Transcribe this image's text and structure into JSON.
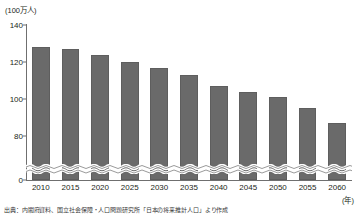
{
  "chart_data": {
    "type": "bar",
    "title": "",
    "subtitle": "",
    "unit_label": "(100万人)",
    "xlabel": "(年)",
    "ylabel": "",
    "categories": [
      "2010",
      "2015",
      "2020",
      "2025",
      "2030",
      "2035",
      "2040",
      "2045",
      "2050",
      "2055",
      "2060"
    ],
    "values": [
      128,
      127,
      124,
      120,
      117,
      113,
      107,
      104,
      101,
      95,
      87
    ],
    "ylim": [
      0,
      140
    ],
    "yticks": [
      0,
      80,
      100,
      120,
      140
    ],
    "ytick_labels": [
      "0",
      "80",
      "100",
      "120",
      "140"
    ],
    "axis_break": true,
    "axis_break_between": [
      0,
      80
    ],
    "grid": false,
    "legend": false,
    "bar_color": "#6a6a6a",
    "axis_color": "#6f6f6f",
    "series": [
      {
        "name": "総人口",
        "values": [
          128,
          127,
          124,
          120,
          117,
          113,
          107,
          104,
          101,
          95,
          87
        ]
      }
    ]
  },
  "axis": {
    "unit_label": "(100万人)",
    "year_unit": "(年)",
    "yticks": [
      {
        "label": "140",
        "value": 140
      },
      {
        "label": "120",
        "value": 120
      },
      {
        "label": "100",
        "value": 100
      },
      {
        "label": "80",
        "value": 80
      },
      {
        "label": "0",
        "value": 0
      }
    ]
  },
  "source": {
    "text": "出典：内閣府資料、国立社会保障・人口問題研究所「日本の将来推計人口」より作成"
  },
  "colors": {
    "bar": "#6a6a6a",
    "axis": "#6f6f6f",
    "text": "#231f20",
    "background": "#ffffff"
  }
}
